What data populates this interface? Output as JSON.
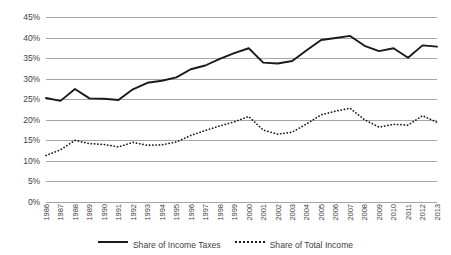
{
  "chart_data": {
    "type": "line",
    "title": "",
    "subtitle": "",
    "xlabel": "",
    "ylabel": "",
    "ylim": [
      0,
      45
    ],
    "ytick_step": 5,
    "ytick_labels": [
      "45%",
      "40%",
      "35%",
      "30%",
      "25%",
      "20%",
      "15%",
      "10%",
      "5%",
      "0%"
    ],
    "ytick_values": [
      45,
      40,
      35,
      30,
      25,
      20,
      15,
      10,
      5,
      0
    ],
    "grid": true,
    "grid_axis": "y",
    "legend_position": "bottom",
    "x_label_rotation": -90,
    "categories": [
      "1986",
      "1987",
      "1988",
      "1989",
      "1990",
      "1991",
      "1992",
      "1993",
      "1994",
      "1995",
      "1996",
      "1997",
      "1998",
      "1999",
      "2000",
      "2001",
      "2002",
      "2003",
      "2004",
      "2005",
      "2006",
      "2007",
      "2008",
      "2009",
      "2010",
      "2011",
      "2012",
      "2013"
    ],
    "series": [
      {
        "name": "Share of Income Taxes",
        "style": "solid",
        "color": "#1a1a1a",
        "values": [
          25.3,
          24.6,
          27.5,
          25.2,
          25.1,
          24.8,
          27.4,
          29.0,
          29.5,
          30.3,
          32.3,
          33.2,
          34.8,
          36.2,
          37.4,
          33.9,
          33.7,
          34.3,
          36.9,
          39.4,
          39.9,
          40.4,
          38.0,
          36.7,
          37.4,
          35.1,
          38.1,
          37.8
        ]
      },
      {
        "name": "Share of Total Income",
        "style": "dotted",
        "color": "#1a1a1a",
        "values": [
          11.3,
          12.7,
          15.0,
          14.2,
          14.0,
          13.4,
          14.5,
          13.8,
          13.9,
          14.6,
          16.2,
          17.4,
          18.5,
          19.5,
          20.8,
          17.5,
          16.5,
          17.0,
          19.0,
          21.2,
          22.1,
          22.8,
          20.0,
          18.2,
          18.9,
          18.7,
          21.0,
          19.4
        ]
      }
    ]
  },
  "legend": {
    "items": [
      {
        "label": "Share of Income Taxes",
        "style": "solid"
      },
      {
        "label": "Share of Total Income",
        "style": "dotted"
      }
    ]
  }
}
